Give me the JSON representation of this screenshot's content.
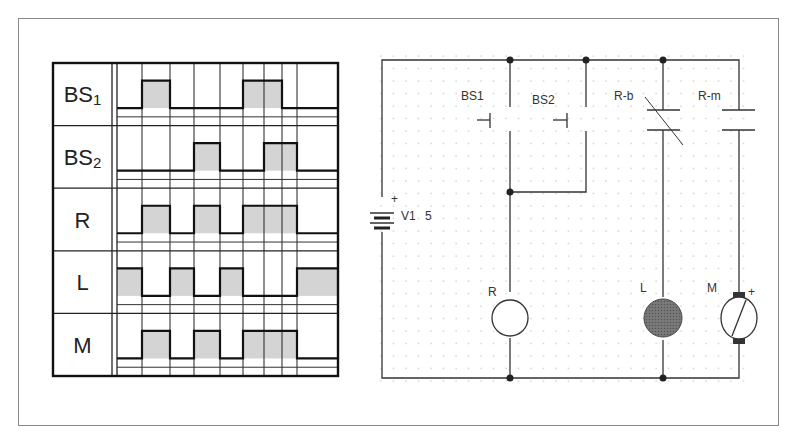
{
  "timing_chart": {
    "rows": [
      {
        "label": "BS",
        "sub": "1",
        "high_segments": [
          [
            142,
            170
          ],
          [
            243,
            282
          ]
        ],
        "initial": "low"
      },
      {
        "label": "BS",
        "sub": "2",
        "high_segments": [
          [
            194,
            220
          ],
          [
            264,
            297
          ]
        ],
        "initial": "low"
      },
      {
        "label": "R",
        "sub": "",
        "high_segments": [
          [
            142,
            170
          ],
          [
            194,
            220
          ],
          [
            243,
            297
          ]
        ],
        "initial": "low"
      },
      {
        "label": "L",
        "sub": "",
        "high_segments": [
          [
            117,
            142
          ],
          [
            170,
            194
          ],
          [
            220,
            243
          ],
          [
            297,
            338
          ]
        ],
        "initial": "high"
      },
      {
        "label": "M",
        "sub": "",
        "high_segments": [
          [
            142,
            170
          ],
          [
            194,
            220
          ],
          [
            243,
            297
          ]
        ],
        "initial": "low"
      }
    ],
    "time_gridlines": [
      142,
      170,
      194,
      220,
      243,
      264,
      282,
      297
    ],
    "fill_color": "#d4d4d4"
  },
  "circuit": {
    "source": {
      "name": "V1",
      "value": "5",
      "polarity": "+"
    },
    "switches": [
      {
        "name": "BS1",
        "type": "normally-open pushbutton"
      },
      {
        "name": "BS2",
        "type": "normally-open pushbutton"
      }
    ],
    "contacts": [
      {
        "name": "R-b",
        "type": "normally-closed relay contact"
      },
      {
        "name": "R-m",
        "type": "normally-open relay contact"
      }
    ],
    "loads": [
      {
        "name": "R",
        "type": "relay coil"
      },
      {
        "name": "L",
        "type": "lamp"
      },
      {
        "name": "M",
        "type": "DC motor",
        "polarity": "+"
      }
    ]
  }
}
